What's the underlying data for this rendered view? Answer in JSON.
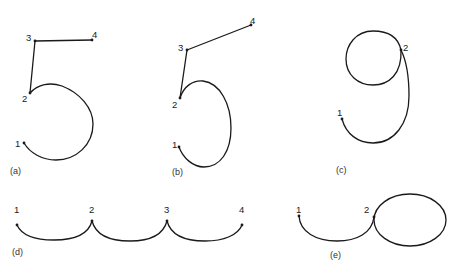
{
  "figure": {
    "panels": [
      {
        "id": "a",
        "caption": "(a)",
        "description": "Digit 5 stroke sequence with points 1-4",
        "points": [
          "1",
          "2",
          "3",
          "4"
        ]
      },
      {
        "id": "b",
        "caption": "(b)",
        "description": "Digit 5 variant with slanted top stroke, points 1-4",
        "points": [
          "1",
          "2",
          "3",
          "4"
        ]
      },
      {
        "id": "c",
        "caption": "(c)",
        "description": "Digit 9 stroke sequence with points 1-2",
        "points": [
          "1",
          "2"
        ]
      },
      {
        "id": "d",
        "caption": "(d)",
        "description": "Three connected arcs through points 1-4",
        "points": [
          "1",
          "2",
          "3",
          "4"
        ]
      },
      {
        "id": "e",
        "caption": "(e)",
        "description": "Arc from 1 to 2 followed by a loop",
        "points": [
          "1",
          "2"
        ]
      }
    ],
    "stroke_color": "#1a1a1a",
    "background": "#ffffff"
  }
}
